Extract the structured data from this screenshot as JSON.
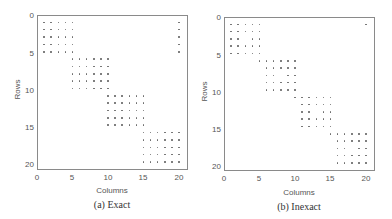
{
  "chart_data": [
    {
      "type": "scatter",
      "subtype": "sparsity-pattern",
      "caption": "(a) Exact",
      "xlabel": "Columns",
      "ylabel": "Rows",
      "xlim": [
        0,
        21
      ],
      "ylim": [
        0,
        21
      ],
      "y_inverted": true,
      "xticks": [
        0,
        5,
        10,
        15,
        20
      ],
      "yticks": [
        0,
        5,
        10,
        15,
        20
      ],
      "grid": false,
      "blocks": [
        {
          "rows": [
            1,
            5
          ],
          "cols": [
            1,
            5
          ]
        },
        {
          "rows": [
            1,
            5
          ],
          "cols": [
            20,
            20
          ]
        },
        {
          "rows": [
            6,
            10
          ],
          "cols": [
            5,
            10
          ]
        },
        {
          "rows": [
            11,
            15
          ],
          "cols": [
            10,
            15
          ]
        },
        {
          "rows": [
            16,
            20
          ],
          "cols": [
            15,
            20
          ]
        }
      ],
      "missing": []
    },
    {
      "type": "scatter",
      "subtype": "sparsity-pattern",
      "caption": "(b) Inexact",
      "xlabel": "Columns",
      "ylabel": "Rows",
      "xlim": [
        0,
        21
      ],
      "ylim": [
        0,
        21
      ],
      "y_inverted": true,
      "xticks": [
        0,
        5,
        10,
        15,
        20
      ],
      "yticks": [
        0,
        5,
        10,
        15,
        20
      ],
      "grid": false,
      "blocks": [
        {
          "rows": [
            1,
            5
          ],
          "cols": [
            1,
            5
          ]
        },
        {
          "rows": [
            1,
            1
          ],
          "cols": [
            20,
            20
          ]
        },
        {
          "rows": [
            6,
            6
          ],
          "cols": [
            5,
            10
          ]
        },
        {
          "rows": [
            7,
            10
          ],
          "cols": [
            6,
            10
          ]
        },
        {
          "rows": [
            11,
            11
          ],
          "cols": [
            10,
            15
          ]
        },
        {
          "rows": [
            12,
            15
          ],
          "cols": [
            11,
            15
          ]
        },
        {
          "rows": [
            16,
            16
          ],
          "cols": [
            15,
            20
          ]
        },
        {
          "rows": [
            17,
            20
          ],
          "cols": [
            16,
            20
          ]
        }
      ],
      "missing": [
        [
          3,
          3
        ],
        [
          8,
          8
        ],
        [
          13,
          13
        ],
        [
          18,
          18
        ]
      ]
    }
  ],
  "panels": [
    {
      "caption": "(a) Exact",
      "xlabel": "Columns",
      "ylabel": "Rows",
      "xtick_labels": [
        "0",
        "5",
        "10",
        "15",
        "20"
      ],
      "ytick_labels": [
        "0",
        "5",
        "10",
        "15",
        "20"
      ]
    },
    {
      "caption": "(b) Inexact",
      "xlabel": "Columns",
      "ylabel": "Rows",
      "xtick_labels": [
        "0",
        "5",
        "10",
        "15",
        "20"
      ],
      "ytick_labels": [
        "0",
        "5",
        "10",
        "15",
        "20"
      ]
    }
  ],
  "colors": {
    "dot": "#666666",
    "axis": "#8a8a8a"
  }
}
